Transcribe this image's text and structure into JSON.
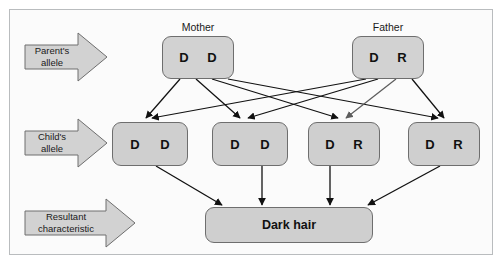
{
  "diagram": {
    "frame": {
      "border_color": "#b9bcbe",
      "background": "#fbfbfb"
    },
    "palette": {
      "box_fill": "#cfcfcf",
      "box_border": "#6e6e6e",
      "arrow_fill": "#d2d2d2",
      "arrow_border": "#6e6e6e",
      "connector": "#111111",
      "text": "#111111"
    },
    "row_labels": [
      {
        "id": "parents-row-label",
        "line1": "Parent's",
        "line2": "allele"
      },
      {
        "id": "children-row-label",
        "line1": "Child's",
        "line2": "allele"
      },
      {
        "id": "result-row-label",
        "line1": "Resultant",
        "line2": "characteristic"
      }
    ],
    "parents": [
      {
        "id": "mother",
        "caption": "Mother",
        "alleles": [
          "D",
          "D"
        ]
      },
      {
        "id": "father",
        "caption": "Father",
        "alleles": [
          "D",
          "R"
        ]
      }
    ],
    "children": [
      {
        "id": "child-1",
        "alleles": [
          "D",
          "D"
        ]
      },
      {
        "id": "child-2",
        "alleles": [
          "D",
          "D"
        ]
      },
      {
        "id": "child-3",
        "alleles": [
          "D",
          "R"
        ]
      },
      {
        "id": "child-4",
        "alleles": [
          "D",
          "R"
        ]
      }
    ],
    "result": {
      "id": "result",
      "label": "Dark hair"
    }
  }
}
